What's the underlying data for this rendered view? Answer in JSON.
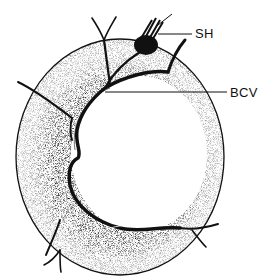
{
  "figure": {
    "labels": [
      {
        "id": "SH",
        "text": "SH"
      },
      {
        "id": "BCV",
        "text": "BCV"
      }
    ]
  },
  "colors": {
    "ink": "#111111",
    "background": "#ffffff"
  }
}
